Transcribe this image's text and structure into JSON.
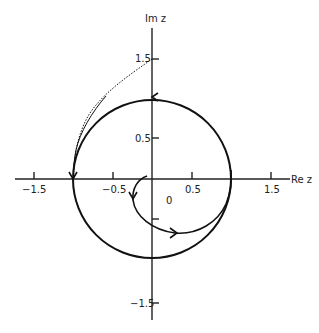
{
  "diagram": {
    "type": "complex-plane-contour",
    "axes": {
      "x_label": "Re z",
      "y_label": "Im z",
      "x_ticks": [
        "−1.5",
        "−0.5",
        "0.5",
        "1.5"
      ],
      "y_ticks": [
        "1.5",
        "0.5",
        "−1.5"
      ],
      "origin_label": "0"
    },
    "curves": [
      {
        "name": "unit-circle",
        "description": "Circle of radius 1 centered at origin, traversed counterclockwise"
      },
      {
        "name": "spiral-path",
        "description": "Path starting near origin spiralling outward to meet the unit circle"
      },
      {
        "name": "dotted-tangent",
        "description": "Dotted line from 1.5i tangent to the circle"
      }
    ],
    "colors": {
      "stroke": "#111111",
      "background": "#ffffff"
    }
  }
}
